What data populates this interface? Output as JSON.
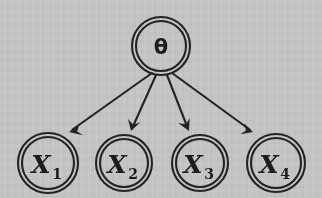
{
  "figure": {
    "type": "directed-graphical-model",
    "background_color": "#c9c9c9",
    "ink_color": "#242424",
    "width": 322,
    "height": 198
  },
  "nodes": [
    {
      "id": "theta",
      "label": "θ",
      "subscript": "",
      "role": "parameter",
      "shape": "double-circle",
      "cx": 161,
      "cy": 46,
      "r_outer": 29,
      "r_inner": 25
    },
    {
      "id": "x1",
      "label": "X",
      "subscript": "1",
      "role": "observation",
      "shape": "double-circle",
      "cx": 48,
      "cy": 163,
      "r_outer": 30,
      "r_inner": 26
    },
    {
      "id": "x2",
      "label": "X",
      "subscript": "2",
      "role": "observation",
      "shape": "double-circle",
      "cx": 124,
      "cy": 163,
      "r_outer": 28,
      "r_inner": 24
    },
    {
      "id": "x3",
      "label": "X",
      "subscript": "3",
      "role": "observation",
      "shape": "double-circle",
      "cx": 200,
      "cy": 163,
      "r_outer": 28,
      "r_inner": 24
    },
    {
      "id": "x4",
      "label": "X",
      "subscript": "4",
      "role": "observation",
      "shape": "double-circle",
      "cx": 276,
      "cy": 163,
      "r_outer": 29,
      "r_inner": 25
    }
  ],
  "edges": [
    {
      "id": "e1",
      "from": "theta",
      "to": "x1",
      "x1": 152,
      "y1": 73,
      "x2": 69,
      "y2": 132,
      "arrowhead": "solid-triangle"
    },
    {
      "id": "e2",
      "from": "theta",
      "to": "x2",
      "x1": 156,
      "y1": 75,
      "x2": 131,
      "y2": 131,
      "arrowhead": "solid-triangle"
    },
    {
      "id": "e3",
      "from": "theta",
      "to": "x3",
      "x1": 167,
      "y1": 75,
      "x2": 189,
      "y2": 131,
      "arrowhead": "solid-triangle"
    },
    {
      "id": "e4",
      "from": "theta",
      "to": "x4",
      "x1": 172,
      "y1": 73,
      "x2": 253,
      "y2": 132,
      "arrowhead": "solid-triangle"
    }
  ]
}
